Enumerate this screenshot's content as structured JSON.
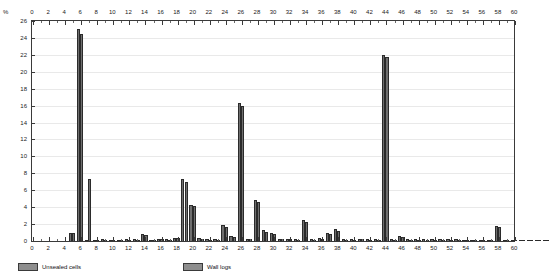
{
  "axes": {
    "y_unit_label": "%",
    "y_ticks": [
      0,
      2,
      4,
      6,
      8,
      10,
      12,
      14,
      16,
      18,
      20,
      22,
      24,
      26
    ],
    "x_ticks": [
      0,
      2,
      4,
      6,
      8,
      10,
      12,
      14,
      16,
      18,
      20,
      22,
      24,
      26,
      28,
      30,
      32,
      34,
      36,
      38,
      40,
      42,
      44,
      46,
      48,
      50,
      52,
      54,
      56,
      58,
      60
    ]
  },
  "legend": {
    "items": [
      {
        "label": "Unsealed cells",
        "color": "#8e8e8e"
      },
      {
        "label": "Wall logs",
        "color": "#8e8e8e"
      }
    ]
  },
  "colors": {
    "bar_fill": "#6f6f6f",
    "bar_stroke": "#2b2b2b",
    "axis": "#3a3a3a",
    "grid": "#e9e9e9",
    "background": "#ffffff"
  },
  "chart_data": {
    "type": "bar",
    "title": "",
    "xlabel": "",
    "ylabel": "%",
    "xlim": [
      0,
      60
    ],
    "ylim": [
      0,
      26
    ],
    "grid": true,
    "legend_position": "bottom",
    "categories": [
      0,
      1,
      2,
      3,
      4,
      5,
      6,
      7,
      8,
      9,
      10,
      11,
      12,
      13,
      14,
      15,
      16,
      17,
      18,
      19,
      20,
      21,
      22,
      23,
      24,
      25,
      26,
      27,
      28,
      29,
      30,
      31,
      32,
      33,
      34,
      35,
      36,
      37,
      38,
      39,
      40,
      41,
      42,
      43,
      44,
      45,
      46,
      47,
      48,
      49,
      50,
      51,
      52,
      53,
      54,
      55,
      56,
      57,
      58,
      59,
      60
    ],
    "series": [
      {
        "name": "Unsealed cells",
        "values": [
          0,
          1.0,
          25.0,
          0.15,
          0.15,
          0.2,
          0.15,
          0.15,
          0.2,
          0.2,
          0.8,
          0.15,
          0.25,
          0.2,
          0.35,
          7.3,
          4.3,
          0.3,
          0.2,
          0.2,
          1.9,
          0.6,
          16.3,
          0.25,
          4.9,
          1.3,
          0.9,
          0.25,
          0.25,
          0.2,
          2.5,
          0.2,
          0.3,
          0.9,
          1.4,
          0.2,
          0.2,
          0.25,
          0.2,
          0.2,
          22.0,
          0.2,
          0.6,
          0.2,
          0.2,
          0.2,
          0.2,
          0.2,
          0.2,
          0.2,
          0.15,
          0.15,
          0.15,
          0.15,
          1.8,
          0.15,
          0.15,
          0.15,
          0.15,
          0.15,
          0.1
        ]
      },
      {
        "name": "Wall logs",
        "values": [
          0,
          0.9,
          24.5,
          7.3,
          0.15,
          0.15,
          0.15,
          0.15,
          0.15,
          0.15,
          0.7,
          0.15,
          0.2,
          0.15,
          0.3,
          7.0,
          4.1,
          0.25,
          0.15,
          0.15,
          1.7,
          0.5,
          16.0,
          0.2,
          4.6,
          1.1,
          0.8,
          0.2,
          0.2,
          0.15,
          2.3,
          0.15,
          0.25,
          0.8,
          1.2,
          0.15,
          0.15,
          0.2,
          0.15,
          0.15,
          21.8,
          0.15,
          0.5,
          0.15,
          0.15,
          0.15,
          0.15,
          0.15,
          0.15,
          0.15,
          0.1,
          0.1,
          0.1,
          0.1,
          1.6,
          0.1,
          0.1,
          0.1,
          0.1,
          0.1,
          0.1
        ]
      }
    ]
  }
}
